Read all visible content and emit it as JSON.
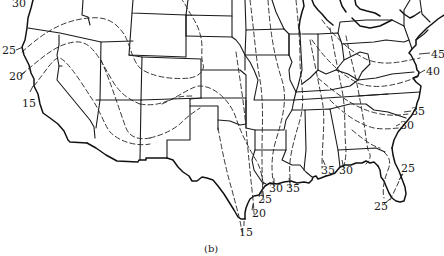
{
  "figure": {
    "caption": "(b)",
    "type": "isoline map of contiguous United States",
    "line_style": {
      "state_borders": "solid",
      "contours": "dashed"
    }
  },
  "contour_labels": {
    "west": [
      {
        "value": "30",
        "x": 12,
        "y": 7
      },
      {
        "value": "25",
        "x": 2,
        "y": 54
      },
      {
        "value": "20",
        "x": 9,
        "y": 80
      },
      {
        "value": "15",
        "x": 22,
        "y": 107
      }
    ],
    "gulf_texas": [
      {
        "value": "15",
        "x": 240,
        "y": 236
      },
      {
        "value": "20",
        "x": 253,
        "y": 217
      },
      {
        "value": "25",
        "x": 259,
        "y": 203
      },
      {
        "value": "30",
        "x": 270,
        "y": 190
      },
      {
        "value": "35",
        "x": 287,
        "y": 190
      },
      {
        "value": "35",
        "x": 322,
        "y": 172
      },
      {
        "value": "30",
        "x": 340,
        "y": 172
      }
    ],
    "east": [
      {
        "value": "45",
        "x": 432,
        "y": 57
      },
      {
        "value": "40",
        "x": 427,
        "y": 74
      },
      {
        "value": "35",
        "x": 412,
        "y": 114
      },
      {
        "value": "30",
        "x": 401,
        "y": 127
      },
      {
        "value": "25",
        "x": 402,
        "y": 170
      },
      {
        "value": "25",
        "x": 375,
        "y": 208
      }
    ]
  },
  "colors": {
    "ink": "#1a1a1a",
    "paper": "#ffffff"
  }
}
